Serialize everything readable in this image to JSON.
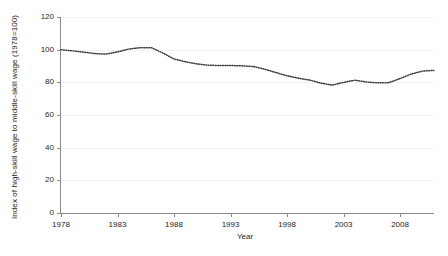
{
  "chart_data": {
    "type": "line",
    "title": "",
    "xlabel": "Year",
    "ylabel": "Index of high-skill wage to middle-skill wage (1978=100)",
    "xlim": [
      1978,
      2011
    ],
    "ylim": [
      0,
      120
    ],
    "grid": true,
    "legend": null,
    "xticks": [
      "1978",
      "1983",
      "1988",
      "1993",
      "1998",
      "2003",
      "2008"
    ],
    "xtick_values": [
      1978,
      1983,
      1988,
      1993,
      1998,
      2003,
      2008
    ],
    "yticks": [
      "0",
      "20",
      "40",
      "60",
      "80",
      "100",
      "120"
    ],
    "ytick_values": [
      0,
      20,
      40,
      60,
      80,
      100,
      120
    ],
    "series_name": "High-skill to middle-skill wage index",
    "line_color": "#3a3a3a",
    "line_style": "dotted",
    "x": [
      1978,
      1979,
      1980,
      1981,
      1982,
      1983,
      1984,
      1985,
      1986,
      1987,
      1988,
      1989,
      1990,
      1991,
      1992,
      1993,
      1994,
      1995,
      1996,
      1997,
      1998,
      1999,
      2000,
      2001,
      2002,
      2003,
      2004,
      2005,
      2006,
      2007,
      2008,
      2009,
      2010,
      2011
    ],
    "values": [
      100.0,
      99.3,
      98.5,
      97.6,
      97.3,
      98.6,
      100.4,
      101.2,
      101.2,
      98.0,
      94.3,
      92.6,
      91.3,
      90.5,
      90.3,
      90.3,
      90.1,
      89.7,
      88.1,
      86.0,
      84.0,
      82.5,
      81.4,
      79.5,
      78.3,
      80.0,
      81.3,
      80.2,
      79.7,
      79.8,
      82.3,
      85.1,
      86.9,
      87.3
    ]
  },
  "axes": {
    "y_title": "Index of high-skill wage to middle-skill wage (1978=100)",
    "x_title": "Year"
  }
}
